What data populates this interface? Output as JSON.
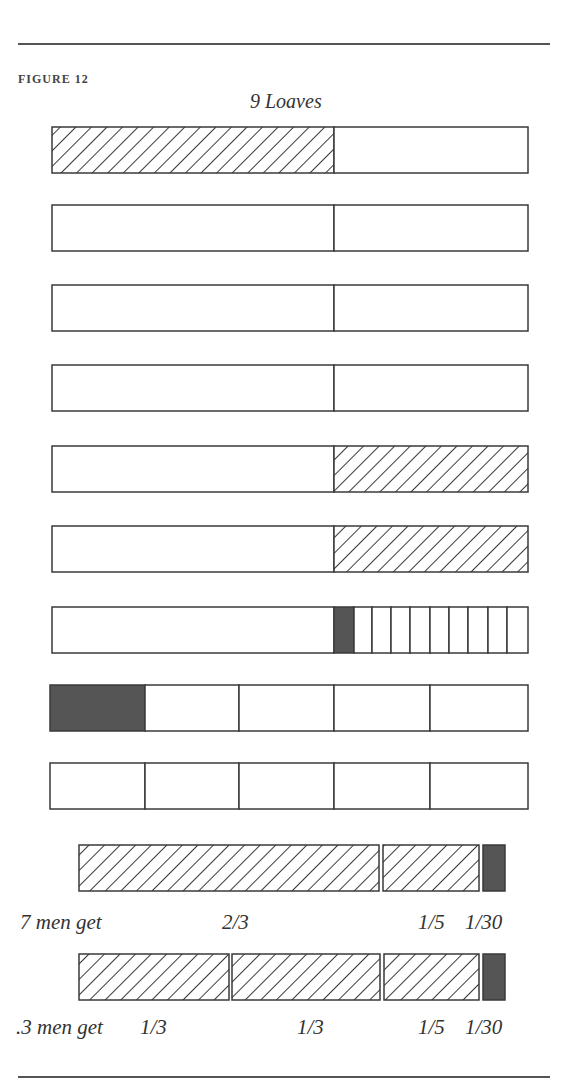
{
  "figure": {
    "caption": "FIGURE 12",
    "title": "9 Loaves"
  },
  "colors": {
    "stroke": "#3a3a3a",
    "dark": "#555555",
    "fill": "#ffffff"
  },
  "loaves": [
    {
      "y": 127,
      "segments": [
        {
          "from": 52,
          "to": 334,
          "fill": "hatch"
        },
        {
          "from": 334,
          "to": 528,
          "fill": "empty"
        }
      ]
    },
    {
      "y": 205,
      "segments": [
        {
          "from": 52,
          "to": 334,
          "fill": "empty"
        },
        {
          "from": 334,
          "to": 528,
          "fill": "empty"
        }
      ]
    },
    {
      "y": 285,
      "segments": [
        {
          "from": 52,
          "to": 334,
          "fill": "empty"
        },
        {
          "from": 334,
          "to": 528,
          "fill": "empty"
        }
      ]
    },
    {
      "y": 365,
      "segments": [
        {
          "from": 52,
          "to": 334,
          "fill": "empty"
        },
        {
          "from": 334,
          "to": 528,
          "fill": "empty"
        }
      ]
    },
    {
      "y": 446,
      "segments": [
        {
          "from": 52,
          "to": 334,
          "fill": "empty"
        },
        {
          "from": 334,
          "to": 528,
          "fill": "hatch"
        }
      ]
    },
    {
      "y": 526,
      "segments": [
        {
          "from": 52,
          "to": 334,
          "fill": "empty"
        },
        {
          "from": 334,
          "to": 528,
          "fill": "hatch"
        }
      ]
    },
    {
      "y": 607,
      "segments": [
        {
          "from": 52,
          "to": 334,
          "fill": "empty"
        },
        {
          "from": 334,
          "to": 354,
          "fill": "dark"
        },
        {
          "from": 354,
          "to": 372,
          "fill": "empty"
        },
        {
          "from": 372,
          "to": 391,
          "fill": "empty"
        },
        {
          "from": 391,
          "to": 410,
          "fill": "empty"
        },
        {
          "from": 410,
          "to": 430,
          "fill": "empty"
        },
        {
          "from": 430,
          "to": 449,
          "fill": "empty"
        },
        {
          "from": 449,
          "to": 468,
          "fill": "empty"
        },
        {
          "from": 468,
          "to": 488,
          "fill": "empty"
        },
        {
          "from": 488,
          "to": 507,
          "fill": "empty"
        },
        {
          "from": 507,
          "to": 528,
          "fill": "empty"
        }
      ]
    },
    {
      "y": 685,
      "segments": [
        {
          "from": 50,
          "to": 145,
          "fill": "dark"
        },
        {
          "from": 145,
          "to": 239,
          "fill": "empty"
        },
        {
          "from": 239,
          "to": 334,
          "fill": "empty"
        },
        {
          "from": 334,
          "to": 430,
          "fill": "empty"
        },
        {
          "from": 430,
          "to": 528,
          "fill": "empty"
        }
      ]
    },
    {
      "y": 763,
      "segments": [
        {
          "from": 50,
          "to": 145,
          "fill": "empty"
        },
        {
          "from": 145,
          "to": 239,
          "fill": "empty"
        },
        {
          "from": 239,
          "to": 334,
          "fill": "empty"
        },
        {
          "from": 334,
          "to": 430,
          "fill": "empty"
        },
        {
          "from": 430,
          "to": 528,
          "fill": "empty"
        }
      ]
    }
  ],
  "bar_height": 46,
  "shares": [
    {
      "y": 845,
      "h": 46,
      "segments": [
        {
          "from": 79,
          "to": 379,
          "fill": "hatch"
        },
        {
          "from": 383,
          "to": 479,
          "fill": "hatch"
        },
        {
          "from": 483,
          "to": 505,
          "fill": "dark"
        }
      ]
    },
    {
      "y": 954,
      "h": 46,
      "segments": [
        {
          "from": 79,
          "to": 229,
          "fill": "hatch"
        },
        {
          "from": 232,
          "to": 380,
          "fill": "hatch"
        },
        {
          "from": 384,
          "to": 479,
          "fill": "hatch"
        },
        {
          "from": 483,
          "to": 505,
          "fill": "dark"
        }
      ]
    }
  ],
  "labels": {
    "seven": {
      "who": "7 men get",
      "a": "2/3",
      "b": "1/5",
      "c": "1/30"
    },
    "three": {
      "who": ".3 men get",
      "a": "1/3",
      "a2": "1/3",
      "b": "1/5",
      "c": "1/30"
    }
  }
}
